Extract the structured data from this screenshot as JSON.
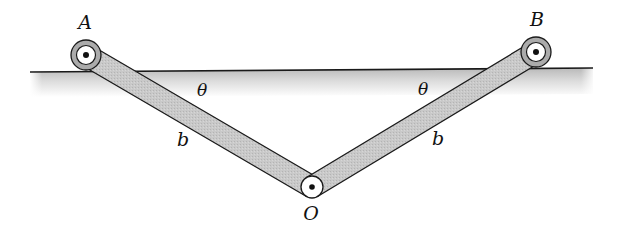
{
  "diagram": {
    "colors": {
      "ink": "#1a1a1a",
      "bar_fill": "#c8c8c8",
      "ground_top": "#bdbdbd",
      "ground_bottom": "#ffffff",
      "pivot_ring": "#a9a9a9",
      "pivot_inner": "#ffffff"
    },
    "ground": {
      "x1": 30,
      "y1": 72,
      "x2": 593,
      "y2": 68,
      "shade_depth": 24
    },
    "pivots": [
      {
        "id": "A",
        "label": "A",
        "cx": 86,
        "cy": 55,
        "r_outer": 15,
        "r_inner": 10,
        "label_x": 85,
        "label_y": 22
      },
      {
        "id": "B",
        "label": "B",
        "cx": 536,
        "cy": 52,
        "r_outer": 15,
        "r_inner": 10,
        "label_x": 537,
        "label_y": 19
      },
      {
        "id": "O",
        "label": "O",
        "cx": 312,
        "cy": 187,
        "r_outer": 11,
        "r_inner": 11,
        "label_x": 311,
        "label_y": 213
      }
    ],
    "bars": [
      {
        "id": "bar-AO",
        "from": "A",
        "to": "O",
        "length_label": "b",
        "label_x": 183,
        "label_y": 139
      },
      {
        "id": "bar-BO",
        "from": "B",
        "to": "O",
        "length_label": "b",
        "label_x": 438,
        "label_y": 138
      }
    ],
    "angles": [
      {
        "id": "theta-left",
        "label": "θ",
        "x": 202,
        "y": 90
      },
      {
        "id": "theta-right",
        "label": "θ",
        "x": 423,
        "y": 89
      }
    ]
  }
}
